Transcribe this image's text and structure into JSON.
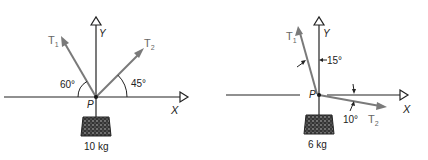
{
  "figures": [
    {
      "id": "left",
      "point_label": "P",
      "x_axis_label": "X",
      "y_axis_label": "Y",
      "tensions": [
        {
          "label": "T",
          "subscript": "1",
          "angle_label": "60°",
          "angle_deg_from_horizontal": 60,
          "side": "left"
        },
        {
          "label": "T",
          "subscript": "2",
          "angle_label": "45°",
          "angle_deg_from_horizontal": 45,
          "side": "right"
        }
      ],
      "mass_label": "10 kg"
    },
    {
      "id": "right",
      "point_label": "P",
      "x_axis_label": "X",
      "y_axis_label": "Y",
      "tensions": [
        {
          "label": "T",
          "subscript": "1",
          "angle_label": "15°",
          "angle_deg_from_vertical": 15,
          "side": "upper-left"
        },
        {
          "label": "T",
          "subscript": "2",
          "angle_label": "10°",
          "angle_deg_below_horizontal": 10,
          "side": "lower-right"
        }
      ],
      "mass_label": "6 kg"
    }
  ],
  "colors": {
    "axis": "#222222",
    "vector": "#7a7a7a",
    "text": "#222222",
    "subscript": "#666666"
  }
}
